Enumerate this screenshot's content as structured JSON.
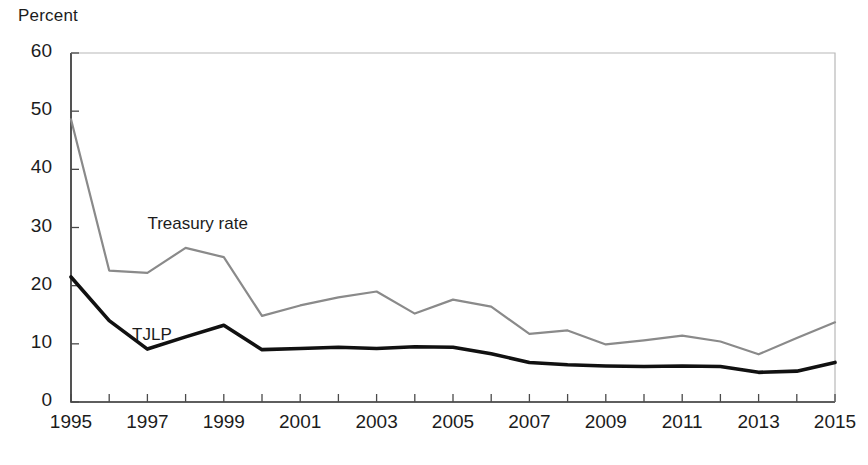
{
  "chart_data": {
    "type": "line",
    "title": "",
    "xlabel": "",
    "ylabel": "Percent",
    "ylim": [
      0,
      60
    ],
    "xlim": [
      1995,
      2015
    ],
    "ytick_values": [
      0,
      10,
      20,
      30,
      40,
      50,
      60
    ],
    "ytick_labels": [
      "0",
      "10",
      "20",
      "30",
      "40",
      "50",
      "60"
    ],
    "x": [
      1995,
      1996,
      1997,
      1998,
      1999,
      2000,
      2001,
      2002,
      2003,
      2004,
      2005,
      2006,
      2007,
      2008,
      2009,
      2010,
      2011,
      2012,
      2013,
      2014,
      2015
    ],
    "xtick_values": [
      1995,
      1996,
      1997,
      1998,
      1999,
      2000,
      2001,
      2002,
      2003,
      2004,
      2005,
      2006,
      2007,
      2008,
      2009,
      2010,
      2011,
      2012,
      2013,
      2014,
      2015
    ],
    "xtick_labels": [
      "1995",
      "",
      "1997",
      "",
      "1999",
      "",
      "2001",
      "",
      "2003",
      "",
      "2005",
      "",
      "2007",
      "",
      "2009",
      "",
      "2011",
      "",
      "2013",
      "",
      "2015"
    ],
    "grid": false,
    "legend": "inline-annotations",
    "series": [
      {
        "name": "Treasury rate",
        "color": "#8a8a8a",
        "width": 2.2,
        "label_x": 1997.0,
        "label_y": 30.5,
        "values": [
          48.6,
          22.6,
          22.2,
          26.5,
          24.9,
          14.8,
          16.6,
          18.0,
          19.0,
          15.2,
          17.6,
          16.4,
          11.7,
          12.3,
          9.9,
          10.6,
          11.4,
          10.4,
          8.2,
          11.0,
          13.7
        ]
      },
      {
        "name": "TJLP",
        "color": "#111111",
        "width": 3.6,
        "label_x": 1996.6,
        "label_y": 11.4,
        "values": [
          21.5,
          14.0,
          9.1,
          11.2,
          13.2,
          9.0,
          9.2,
          9.4,
          9.2,
          9.5,
          9.4,
          8.3,
          6.8,
          6.4,
          6.2,
          6.1,
          6.2,
          6.1,
          5.1,
          5.3,
          6.8
        ]
      }
    ]
  },
  "axis": {
    "y_axis_title": "Percent"
  }
}
